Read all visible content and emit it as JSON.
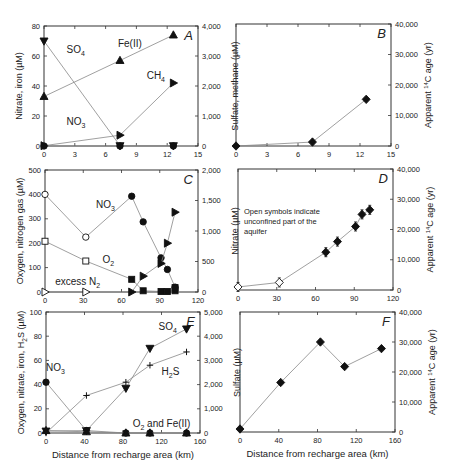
{
  "figure": {
    "x_axis_label": "Distance from recharge area (km)",
    "colors": {
      "frame": "#333333",
      "line": "#888888",
      "marker": "#111111",
      "text": "#222222"
    }
  },
  "chart_data": [
    {
      "panel": "A",
      "type": "line",
      "frame": {
        "x": 44,
        "y": 26,
        "w": 154,
        "h": 120
      },
      "xlim": [
        0,
        15
      ],
      "xticks": [
        "0",
        "3",
        "6",
        "9",
        "12",
        "15"
      ],
      "ylim_left": [
        0,
        80
      ],
      "yticks_left": [
        "0",
        "20",
        "40",
        "60",
        "80"
      ],
      "ylabel_left": "Nitrate, iron (µM)",
      "ylim_right": [
        0,
        4000
      ],
      "yticks_right": [
        "0",
        "1,000",
        "2,000",
        "3,000",
        "4,000"
      ],
      "ylabel_right": "Sulfate, methane (µM)",
      "series": [
        {
          "name": "Fe(II)",
          "axis": "left",
          "marker": "tri-up",
          "x": [
            0,
            7.4,
            12.6
          ],
          "y": [
            33,
            57,
            74
          ],
          "label": {
            "text": "Fe(II)",
            "x": 7.2,
            "y": 66
          }
        },
        {
          "name": "SO4",
          "axis": "right",
          "marker": "tri-down",
          "x": [
            0,
            7.4,
            12.6
          ],
          "y": [
            3500,
            10,
            10
          ],
          "label": {
            "text": "SO",
            "sub": "4",
            "x": 2.2,
            "y": 3100
          }
        },
        {
          "name": "CH4",
          "axis": "right",
          "marker": "tri-right",
          "x": [
            0,
            7.4,
            12.6
          ],
          "y": [
            10,
            360,
            2100
          ],
          "label": {
            "text": "CH",
            "sub": "4",
            "x": 10,
            "y": 2250
          }
        },
        {
          "name": "NO3",
          "axis": "left",
          "marker": "circle",
          "x": [
            0,
            7.4,
            12.6
          ],
          "y": [
            0,
            0,
            0
          ],
          "label": {
            "text": "NO",
            "sub": "3",
            "x": 2.2,
            "y": 14
          }
        }
      ]
    },
    {
      "panel": "B",
      "type": "line",
      "frame": {
        "x": 236,
        "y": 24,
        "w": 155,
        "h": 122
      },
      "xlim": [
        0,
        15
      ],
      "xticks": [
        "0",
        "3",
        "6",
        "9",
        "12",
        "15"
      ],
      "ylim_right": [
        0,
        40000
      ],
      "yticks_right": [
        "0",
        "10,000",
        "20,000",
        "30,000",
        "40,000"
      ],
      "ylabel_right": "Apparent 14C age (yr)",
      "series": [
        {
          "name": "14C age",
          "axis": "right",
          "marker": "diamond",
          "x": [
            0,
            7.4,
            12.6
          ],
          "y": [
            0,
            1300,
            15300
          ]
        }
      ]
    },
    {
      "panel": "C",
      "type": "line",
      "frame": {
        "x": 45,
        "y": 170,
        "w": 153,
        "h": 122
      },
      "xlim": [
        0,
        120
      ],
      "xticks": [
        "0",
        "30",
        "60",
        "90",
        "120"
      ],
      "ylim_left": [
        0,
        500
      ],
      "yticks_left": [
        "0",
        "100",
        "200",
        "300",
        "400",
        "500"
      ],
      "ylabel_left": "Oxygen, nitrogen gas (µM)",
      "ylim_right": [
        0,
        2000
      ],
      "yticks_right": [
        "0",
        "500",
        "1,000",
        "1,500",
        "2,000"
      ],
      "ylabel_right": "Nitrate (µM)",
      "series": [
        {
          "name": "NO3",
          "axis": "right",
          "marker": "circle",
          "open_first": 2,
          "x": [
            0,
            32,
            68,
            77,
            91,
            96,
            102
          ],
          "y": [
            1600,
            900,
            1570,
            1150,
            560,
            370,
            80
          ],
          "label": {
            "text": "NO",
            "sub": "3",
            "x": 40,
            "y": 1370
          }
        },
        {
          "name": "O2",
          "axis": "left",
          "marker": "square",
          "open_first": 2,
          "x": [
            0,
            32,
            68,
            77,
            91,
            96,
            102,
            102
          ],
          "y": [
            208,
            127,
            52,
            5,
            2,
            2,
            5,
            18
          ],
          "label": {
            "text": "O",
            "sub": "2",
            "x": 45,
            "y": 120
          }
        },
        {
          "name": "excess N2",
          "axis": "left",
          "marker": "tri-right",
          "open_first": 2,
          "x": [
            0,
            32,
            68,
            77,
            91,
            96,
            102
          ],
          "y": [
            0,
            0,
            0,
            65,
            117,
            200,
            327
          ],
          "label": {
            "text": "excess N",
            "sub": "2",
            "x": 8,
            "y": 28
          }
        }
      ]
    },
    {
      "panel": "D",
      "type": "scatter",
      "frame": {
        "x": 238,
        "y": 169,
        "w": 155,
        "h": 121
      },
      "xlim": [
        0,
        120
      ],
      "xticks": [
        "0",
        "30",
        "60",
        "90",
        "120"
      ],
      "ylim_right": [
        0,
        40000
      ],
      "yticks_right": [
        "0",
        "10,000",
        "20,000",
        "30,000",
        "40,000"
      ],
      "ylabel_right": "Apparent 14C age (yr)",
      "annotation": [
        "Open symbols indicate",
        "unconfined part of the",
        "aquifer"
      ],
      "series": [
        {
          "name": "14C age",
          "axis": "right",
          "marker": "diamond",
          "open_first": 2,
          "errorbar": 1500,
          "x": [
            0,
            32,
            68,
            77,
            91,
            96,
            102
          ],
          "y": [
            1000,
            2500,
            12500,
            16000,
            21000,
            25000,
            26500
          ]
        }
      ]
    },
    {
      "panel": "E",
      "type": "line",
      "frame": {
        "x": 46,
        "y": 312,
        "w": 154,
        "h": 121
      },
      "xlim": [
        0,
        160
      ],
      "xticks": [
        "0",
        "40",
        "80",
        "120",
        "160"
      ],
      "ylim_left": [
        0,
        100
      ],
      "yticks_left": [
        "0",
        "20",
        "40",
        "60",
        "80",
        "100"
      ],
      "ylabel_left": "Oxygen, nitrate, iron, H2S (µM)",
      "ylim_right": [
        0,
        5000
      ],
      "yticks_right": [
        "0",
        "1,000",
        "2,000",
        "3,000",
        "4,000",
        "5,000"
      ],
      "ylabel_right": "Sulfate (µM)",
      "series": [
        {
          "name": "SO4",
          "axis": "right",
          "marker": "tri-down",
          "x": [
            0,
            42,
            83,
            108,
            146
          ],
          "y": [
            80,
            100,
            1850,
            3500,
            4300
          ],
          "label": {
            "text": "SO",
            "sub": "4",
            "x": 117,
            "y": 4250
          }
        },
        {
          "name": "H2S",
          "axis": "left",
          "marker": "plus",
          "x": [
            0,
            42,
            83,
            108,
            146
          ],
          "y": [
            0,
            31,
            42,
            56,
            67
          ],
          "label": {
            "text": "H",
            "sub": "2",
            "tail": "S",
            "x": 120,
            "y": 48
          }
        },
        {
          "name": "NO3",
          "axis": "left",
          "marker": "circle",
          "x": [
            0,
            42,
            83,
            108,
            146
          ],
          "y": [
            42,
            2,
            0,
            0,
            0
          ],
          "label": {
            "text": "NO",
            "sub": "3",
            "x": 0,
            "y": 51
          }
        },
        {
          "name": "O2 and Fe(II)",
          "axis": "left",
          "marker": "tri-up",
          "x": [
            0,
            42,
            83,
            108,
            146
          ],
          "y": [
            2,
            1,
            0,
            0,
            0
          ],
          "label": {
            "text": "O",
            "sub": "2",
            "tail": " and Fe(II)",
            "x": 90,
            "y": 5
          }
        }
      ]
    },
    {
      "panel": "F",
      "type": "line",
      "frame": {
        "x": 240,
        "y": 312,
        "w": 155,
        "h": 120
      },
      "xlim": [
        0,
        160
      ],
      "xticks": [
        "0",
        "40",
        "80",
        "120",
        "160"
      ],
      "ylim_right": [
        0,
        40000
      ],
      "yticks_right": [
        "0",
        "10,000",
        "20,000",
        "30,000",
        "40,000"
      ],
      "ylabel_right": "Apparent 14C age (yr)",
      "series": [
        {
          "name": "14C age",
          "axis": "right",
          "marker": "diamond",
          "x": [
            0,
            42,
            83,
            108,
            146
          ],
          "y": [
            1000,
            16500,
            30000,
            21800,
            27800
          ]
        }
      ]
    }
  ]
}
